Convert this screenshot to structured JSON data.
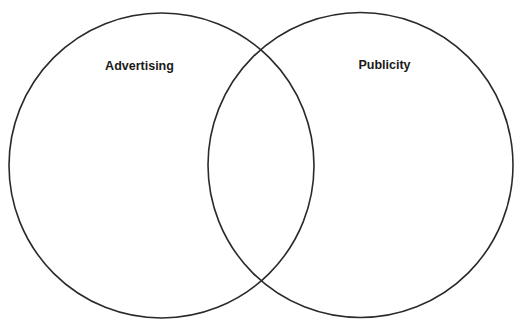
{
  "diagram": {
    "type": "venn",
    "sets": [
      {
        "id": "advertising",
        "label": "Advertising",
        "center": [
          161.5,
          165.5
        ],
        "radius": 152.5,
        "label_pos": [
          139.5,
          70
        ]
      },
      {
        "id": "publicity",
        "label": "Publicity",
        "center": [
          360.5,
          165
        ],
        "radius": 152.5,
        "label_pos": [
          384.5,
          69
        ]
      }
    ],
    "intersection_label": "",
    "stroke_color": "#2a2a2a",
    "background_color": "#ffffff"
  }
}
